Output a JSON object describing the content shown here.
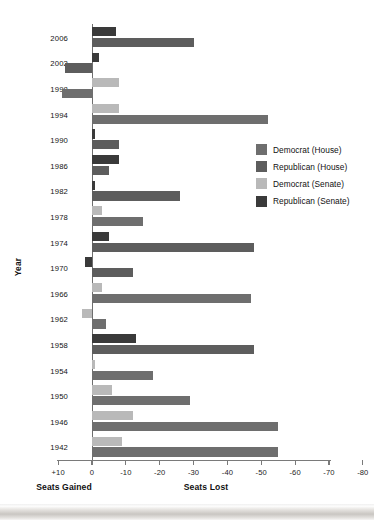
{
  "chart_data": {
    "type": "bar",
    "orientation": "horizontal",
    "title": "",
    "xlabel": "Seats Lost",
    "xlabel_left": "Seats Gained",
    "ylabel": "Year",
    "xlim": [
      10,
      -80
    ],
    "xticks": [
      "+10",
      "0",
      "-10",
      "-20",
      "-30",
      "-40",
      "-50",
      "-60",
      "-70",
      "-80"
    ],
    "xtick_values": [
      10,
      0,
      -10,
      -20,
      -30,
      -40,
      -50,
      -60,
      -70,
      -80
    ],
    "grid": false,
    "legend_position": "right",
    "note": "Negative values are seats lost (bars extend right of zero); positive values are seats gained (bars extend left of zero).",
    "categories": [
      "2006",
      "2002",
      "1998",
      "1994",
      "1990",
      "1986",
      "1982",
      "1978",
      "1974",
      "1970",
      "1966",
      "1962",
      "1958",
      "1954",
      "1950",
      "1946",
      "1942"
    ],
    "series": [
      {
        "name": "Democrat (House)",
        "color": "#6e6e6e",
        "values": [
          null,
          null,
          9,
          -52,
          null,
          null,
          null,
          -15,
          null,
          null,
          -47,
          -4,
          null,
          -18,
          -29,
          -55,
          -55
        ]
      },
      {
        "name": "Republican (House)",
        "color": "#5d5d5d",
        "values": [
          -30,
          8,
          null,
          null,
          -8,
          -5,
          -26,
          null,
          -48,
          -12,
          null,
          null,
          -48,
          null,
          null,
          null,
          null
        ]
      },
      {
        "name": "Democrat (Senate)",
        "color": "#b9b9b9",
        "values": [
          null,
          null,
          -8,
          -8,
          null,
          null,
          null,
          -3,
          null,
          null,
          -3,
          3,
          null,
          -1,
          -6,
          -12,
          -9
        ]
      },
      {
        "name": "Republican (Senate)",
        "color": "#3a3a3a",
        "values": [
          -7,
          -2,
          null,
          null,
          -1,
          -8,
          -1,
          null,
          -5,
          2,
          null,
          null,
          -13,
          null,
          null,
          null,
          null
        ]
      }
    ]
  },
  "legend": {
    "items": [
      {
        "label": "Democrat (House)",
        "color": "#6e6e6e"
      },
      {
        "label": "Republican (House)",
        "color": "#5d5d5d"
      },
      {
        "label": "Democrat (Senate)",
        "color": "#b9b9b9"
      },
      {
        "label": "Republican (Senate)",
        "color": "#3a3a3a"
      }
    ]
  }
}
